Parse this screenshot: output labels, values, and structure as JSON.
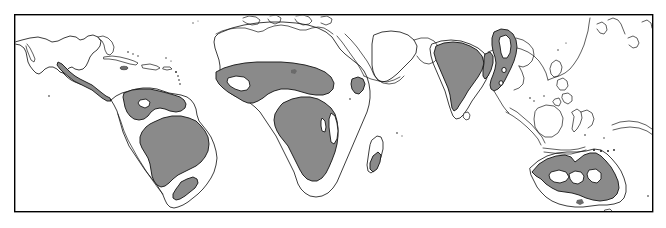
{
  "figure": {
    "kind": "world-distribution-map",
    "title": "",
    "caption": "",
    "width": 666,
    "height": 228,
    "background_color": "#ffffff",
    "frame": {
      "x": 14,
      "y": 14,
      "width": 639,
      "height": 198,
      "stroke_color": "#000000",
      "fill_color": "#ffffff"
    }
  },
  "legend": {
    "visible": false,
    "entries": [
      {
        "label": "Distribution range",
        "swatch_color": "#8a8a8a",
        "outline_color": "#1a1a1a"
      },
      {
        "label": "Outside range",
        "swatch_color": "#ffffff",
        "outline_color": "#1a1a1a"
      }
    ]
  },
  "colors": {
    "shaded_range": "#8a8a8a",
    "coastline": "#1a1a1a",
    "land_unshaded": "#ffffff",
    "ocean": "#ffffff",
    "frame": "#000000"
  },
  "projection": {
    "type": "equirectangular",
    "latitude_range": "approx 40N to 40S",
    "longitude_range": "approx 130W to 180E"
  },
  "regions": [
    {
      "id": "central-america",
      "name": "Central America coastal strip",
      "continent": "Americas",
      "shaded": true
    },
    {
      "id": "northern-south-america",
      "name": "Northern South America (Venezuela, Guyana, Colombia)",
      "continent": "Americas",
      "shaded": true
    },
    {
      "id": "amazon-basin",
      "name": "Amazon Basin and central Brazil",
      "continent": "Americas",
      "shaded": true
    },
    {
      "id": "southeast-brazil",
      "name": "Southeast Brazil coastal strip",
      "continent": "Americas",
      "shaded": true
    },
    {
      "id": "sahel-west-africa",
      "name": "Sahel and West Africa belt",
      "continent": "Africa",
      "shaded": true
    },
    {
      "id": "central-southern-africa",
      "name": "Central and Southern Africa",
      "continent": "Africa",
      "shaded": true
    },
    {
      "id": "horn-of-africa",
      "name": "Ethiopian highlands patch",
      "continent": "Africa",
      "shaded": true
    },
    {
      "id": "madagascar",
      "name": "Madagascar",
      "continent": "Africa",
      "shaded": true
    },
    {
      "id": "indian-subcontinent",
      "name": "Indian subcontinent",
      "continent": "Asia",
      "shaded": true
    },
    {
      "id": "indochina",
      "name": "Indochina peninsula and Myanmar",
      "continent": "Asia",
      "shaded": true
    },
    {
      "id": "northern-australia",
      "name": "Northern and eastern Australia",
      "continent": "Oceania",
      "shaded": true
    }
  ],
  "unshaded_landmasses": [
    "North America",
    "Southern South America",
    "Sahara and North Africa",
    "Arabian Peninsula",
    "Europe and Mediterranean",
    "Southern Africa interior",
    "Indonesia",
    "Philippines",
    "East Asia",
    "Central Australia",
    "New Guinea"
  ]
}
